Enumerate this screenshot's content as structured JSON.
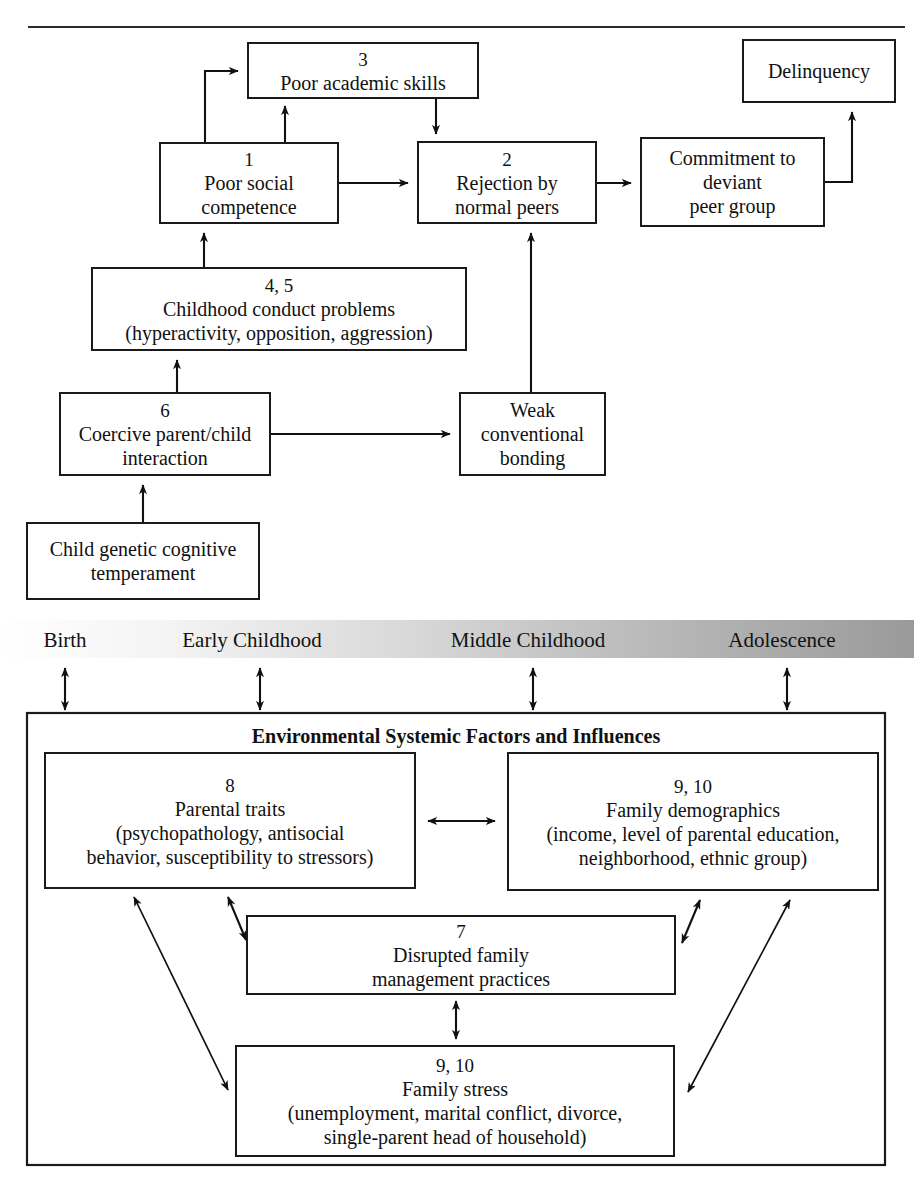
{
  "figure": {
    "header_rule": true
  },
  "upper_model": {
    "nodes": [
      {
        "id": "poor-academic-skills",
        "number": "3",
        "lines": [
          "Poor academic skills"
        ],
        "x": 248,
        "y": 43,
        "w": 230,
        "h": 55
      },
      {
        "id": "delinquency",
        "number": "",
        "lines": [
          "Delinquency"
        ],
        "x": 743,
        "y": 40,
        "w": 152,
        "h": 62
      },
      {
        "id": "poor-social-competence",
        "number": "1",
        "lines": [
          "Poor social",
          "competence"
        ],
        "x": 160,
        "y": 143,
        "w": 178,
        "h": 80
      },
      {
        "id": "rejection-by-normal-peers",
        "number": "2",
        "lines": [
          "Rejection by",
          "normal peers"
        ],
        "x": 418,
        "y": 142,
        "w": 178,
        "h": 81
      },
      {
        "id": "commitment-to-deviant-peer-group",
        "number": "",
        "lines": [
          "Commitment to",
          "deviant",
          "peer group"
        ],
        "x": 641,
        "y": 138,
        "w": 183,
        "h": 88
      },
      {
        "id": "childhood-conduct-problems",
        "number": "4, 5",
        "lines": [
          "Childhood conduct problems",
          "(hyperactivity, opposition, aggression)"
        ],
        "x": 92,
        "y": 268,
        "w": 374,
        "h": 82
      },
      {
        "id": "coercive-parent-child-interaction",
        "number": "6",
        "lines": [
          "Coercive parent/child",
          "interaction"
        ],
        "x": 60,
        "y": 393,
        "w": 210,
        "h": 82
      },
      {
        "id": "weak-conventional-bonding",
        "number": "",
        "lines": [
          "Weak",
          "conventional",
          "bonding"
        ],
        "x": 460,
        "y": 393,
        "w": 145,
        "h": 82
      },
      {
        "id": "child-genetic-cognitive-temperament",
        "number": "",
        "lines": [
          "Child genetic cognitive",
          "temperament"
        ],
        "x": 27,
        "y": 523,
        "w": 232,
        "h": 76
      }
    ]
  },
  "timeline": {
    "band": {
      "x": 0,
      "y": 620,
      "w": 914,
      "h": 38
    },
    "gradient_from": "#fdfdfd",
    "gradient_to": "#9d9d9d",
    "stages": [
      {
        "label": "Birth",
        "x": 65,
        "arrow_x": 65
      },
      {
        "label": "Early Childhood",
        "x": 252,
        "arrow_x": 260
      },
      {
        "label": "Middle Childhood",
        "x": 528,
        "arrow_x": 533
      },
      {
        "label": "Adolescence",
        "x": 782,
        "arrow_x": 787
      }
    ]
  },
  "environmental": {
    "title": "Environmental Systemic Factors and Influences",
    "outer": {
      "x": 27,
      "y": 713,
      "w": 858,
      "h": 452
    },
    "nodes": [
      {
        "id": "parental-traits",
        "number": "8",
        "lines": [
          "Parental traits",
          "(psychopathology, antisocial",
          "behavior, susceptibility to stressors)"
        ],
        "x": 45,
        "y": 753,
        "w": 370,
        "h": 135
      },
      {
        "id": "family-demographics",
        "number": "9, 10",
        "lines": [
          "Family demographics",
          "(income, level of parental education,",
          "neighborhood, ethnic group)"
        ],
        "x": 508,
        "y": 753,
        "w": 370,
        "h": 137
      },
      {
        "id": "disrupted-family-management-practices",
        "number": "7",
        "lines": [
          "Disrupted family",
          "management practices"
        ],
        "x": 247,
        "y": 916,
        "w": 428,
        "h": 78
      },
      {
        "id": "family-stress",
        "number": "9, 10",
        "lines": [
          "Family stress",
          "(unemployment, marital conflict, divorce,",
          "single-parent head of household)"
        ],
        "x": 236,
        "y": 1046,
        "w": 438,
        "h": 110
      }
    ]
  }
}
